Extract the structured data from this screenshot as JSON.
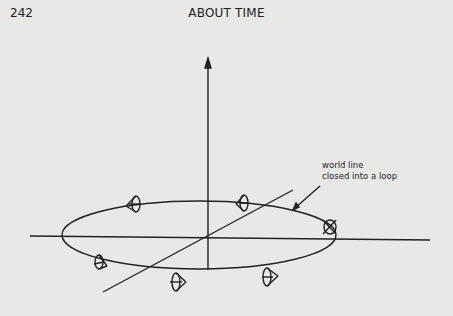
{
  "page": {
    "number": "242",
    "running_head": "ABOUT TIME"
  },
  "figure": {
    "annotation": {
      "line1": "world line",
      "line2": "closed into a loop"
    },
    "elements": [
      "vertical axis with arrow",
      "horizontal axis",
      "diagonal axis",
      "elliptical loop",
      "7 light cones along loop"
    ]
  }
}
